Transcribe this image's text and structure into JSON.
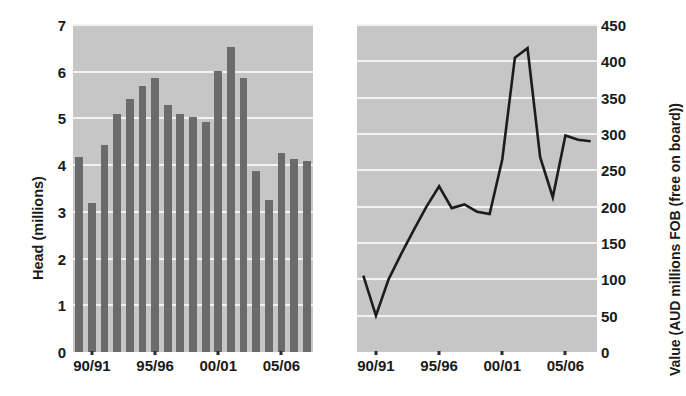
{
  "chart_data": [
    {
      "type": "bar",
      "panel": "left",
      "title": "",
      "xlabel": "",
      "ylabel": "Head (millions)",
      "ylim": [
        0,
        7
      ],
      "yticks": [
        0,
        1,
        2,
        3,
        4,
        5,
        6,
        7
      ],
      "grid": true,
      "categories": [
        "89/90",
        "90/91",
        "91/92",
        "92/93",
        "93/94",
        "94/95",
        "95/96",
        "96/97",
        "97/98",
        "98/99",
        "99/00",
        "00/01",
        "01/02",
        "02/03",
        "03/04",
        "04/05",
        "05/06",
        "06/07",
        "07/08"
      ],
      "xtick_labels": [
        "90/91",
        "95/96",
        "00/01",
        "05/06"
      ],
      "xtick_categories": [
        "90/91",
        "95/96",
        "00/01",
        "05/06"
      ],
      "values": [
        4.18,
        3.2,
        4.43,
        5.1,
        5.42,
        5.7,
        5.87,
        5.28,
        5.1,
        5.03,
        4.93,
        6.02,
        6.52,
        5.87,
        3.87,
        3.25,
        4.25,
        4.14,
        4.08
      ],
      "bar_color": "#6b6b6b",
      "plot_background": "#c6c6c6"
    },
    {
      "type": "line",
      "panel": "right",
      "title": "",
      "xlabel": "",
      "ylabel": "Value (AUD millions FOB (free on board))",
      "ylim": [
        0,
        450
      ],
      "yticks": [
        0,
        50,
        100,
        150,
        200,
        250,
        300,
        350,
        400,
        450
      ],
      "grid": true,
      "x": [
        "89/90",
        "90/91",
        "91/92",
        "92/93",
        "93/94",
        "94/95",
        "95/96",
        "96/97",
        "97/98",
        "98/99",
        "99/00",
        "00/01",
        "01/02",
        "02/03",
        "03/04",
        "04/05",
        "05/06",
        "06/07",
        "07/08"
      ],
      "xtick_labels": [
        "90/91",
        "95/96",
        "00/01",
        "05/06"
      ],
      "values": [
        105,
        50,
        100,
        135,
        168,
        200,
        228,
        198,
        203,
        193,
        190,
        265,
        405,
        418,
        268,
        213,
        298,
        292,
        290
      ],
      "line_color": "#1c1c1c",
      "plot_background": "#c6c6c6"
    }
  ],
  "left_chart": {
    "ylabel": "Head (millions)",
    "yticks": [
      "7",
      "6",
      "5",
      "4",
      "3",
      "2",
      "1",
      "0"
    ],
    "xtick_labels": [
      "90/91",
      "95/96",
      "00/01",
      "05/06"
    ]
  },
  "right_chart": {
    "ylabel": "Value (AUD millions FOB (free on board))",
    "yticks": [
      "450",
      "400",
      "350",
      "300",
      "250",
      "200",
      "150",
      "100",
      "50",
      "0"
    ],
    "xtick_labels": [
      "90/91",
      "95/96",
      "00/01",
      "05/06"
    ]
  }
}
